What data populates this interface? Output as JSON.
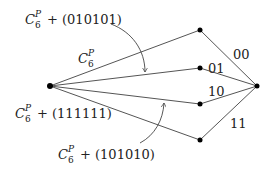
{
  "diagram": {
    "nodes": [
      {
        "id": "left",
        "x": 50,
        "y": 86
      },
      {
        "id": "top",
        "x": 200,
        "y": 30
      },
      {
        "id": "mid01",
        "x": 200,
        "y": 68
      },
      {
        "id": "mid10",
        "x": 200,
        "y": 104
      },
      {
        "id": "bot",
        "x": 200,
        "y": 140
      },
      {
        "id": "right",
        "x": 257,
        "y": 86
      }
    ],
    "edge_labels": {
      "e00": "00",
      "e01": "01",
      "e10": "10",
      "e11": "11"
    },
    "labels": {
      "top_base": "C",
      "top_sub": "6",
      "top_sup": "P",
      "top_suffix": "+ (010101)",
      "mid_base": "C",
      "mid_sub": "6",
      "mid_sup": "P",
      "left_base": "C",
      "left_sub": "6",
      "left_sup": "P",
      "left_suffix": "+ (111111)",
      "bottom_base": "C",
      "bottom_sub": "6",
      "bottom_sup": "P",
      "bottom_suffix": "+ (101010)"
    },
    "colors": {
      "line": "#444444",
      "node": "#000000",
      "text": "#222222"
    }
  }
}
